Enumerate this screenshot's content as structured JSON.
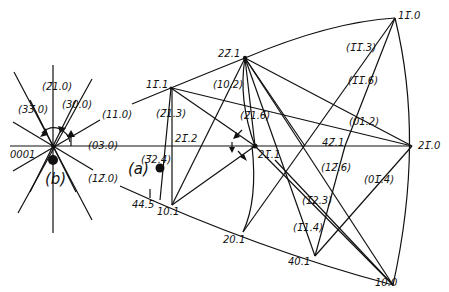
{
  "diagram": {
    "type": "stereographic-projection",
    "inset_label": "(b)",
    "main_label": "(a)",
    "inset_labels": {
      "origin": "0001",
      "p21_0": "(2̄1.0)",
      "p33_0": "(33̄.0)",
      "p30_0": "(30.0)",
      "p11_0": "(11.0)",
      "p03_0": "(03.0)",
      "p12_0": "(12̄.0)"
    },
    "poles": {
      "p11_1": "11̄.1",
      "p22_1": "22̄.1",
      "p11_0": "11̄.0",
      "p21_0": "21̄.0",
      "p21_1": "21̄.1",
      "p21_2": "21̄.2",
      "p42_1": "42̄.1",
      "p10_1": "10.1",
      "p20_1": "20.1",
      "p40_1": "40.1",
      "p10_0": "10.0",
      "p44_5": "44.5"
    },
    "planes": {
      "p21_3": "(2̄1.3)",
      "p32_4": "(3̄2.4)",
      "p10_2": "(10.2)",
      "p21_6": "(2̄1.6)",
      "p11_3": "(1̄1̄.3)",
      "p11_6": "(1̄1̄.6)",
      "p01_2": "(01.2)",
      "p12_6": "(12̄.6)",
      "p01_4": "(01̄.4)",
      "p12_3": "(1̄2.3)",
      "p11_4": "(1̄1.4)"
    }
  }
}
